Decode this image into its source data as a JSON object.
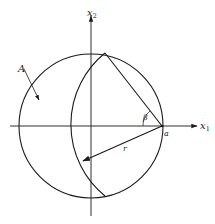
{
  "figure": {
    "labels": {
      "x2_axis": "x",
      "x2_sub": "2",
      "x1_axis": "x",
      "x1_sub": "1",
      "point_a": "a",
      "angle": "β",
      "radius": "r",
      "region": "A"
    },
    "colors": {
      "stroke": "#1a1a1a",
      "background": "#ffffff"
    }
  }
}
